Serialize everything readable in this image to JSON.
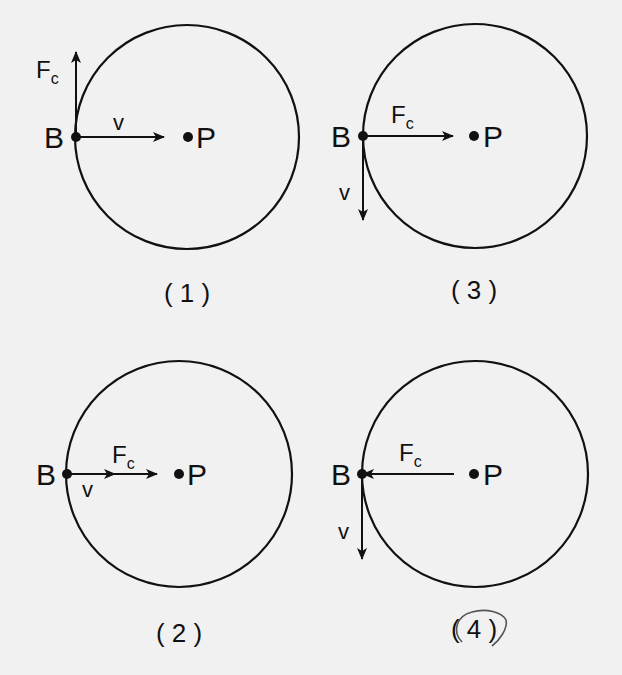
{
  "diagrams": [
    {
      "id": "1",
      "caption": "( 1 )",
      "point_b_label": "B",
      "point_p_label": "P",
      "force_label": "F",
      "force_sub": "c",
      "velocity_label": "v",
      "force_direction": "up (tangent)",
      "velocity_direction": "right (toward center P)"
    },
    {
      "id": "3",
      "caption": "( 3 )",
      "point_b_label": "B",
      "point_p_label": "P",
      "force_label": "F",
      "force_sub": "c",
      "velocity_label": "v",
      "force_direction": "right (toward center P)",
      "velocity_direction": "down (tangent)"
    },
    {
      "id": "2",
      "caption": "( 2 )",
      "point_b_label": "B",
      "point_p_label": "P",
      "force_label": "F",
      "force_sub": "c",
      "velocity_label": "v",
      "force_direction": "right (toward center P)",
      "velocity_direction": "right (toward center P)"
    },
    {
      "id": "4",
      "caption": "( 4 )",
      "caption_circled": true,
      "point_b_label": "B",
      "point_p_label": "P",
      "force_label": "F",
      "force_sub": "c",
      "velocity_label": "v",
      "force_direction": "left (away from center P)",
      "velocity_direction": "down (tangent)"
    }
  ],
  "colors": {
    "background": "#f1f1f1",
    "ink": "#111111",
    "pencil": "#555555"
  }
}
